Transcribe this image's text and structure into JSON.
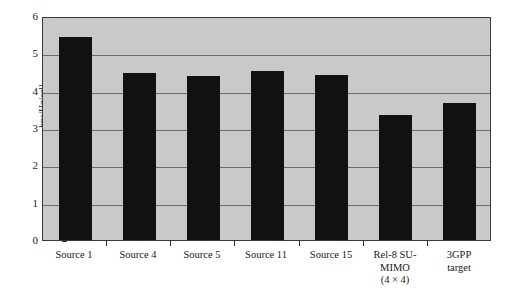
{
  "chart_data": {
    "type": "bar",
    "title": "",
    "subtitle": "",
    "xlabel": "",
    "ylabel": "bps/Hz/cell",
    "ylim": [
      0,
      6
    ],
    "yticks": [
      "0",
      "1",
      "2",
      "3",
      "4",
      "5",
      "6"
    ],
    "grid": "horizontal",
    "legend": "none",
    "categories": [
      "Source 1",
      "Source 4",
      "Source 5",
      "Source 11",
      "Source 15",
      "Rel-8 SU-MIMO (4 × 4)",
      "3GPP target"
    ],
    "category_label_lines": [
      [
        "Source 1"
      ],
      [
        "Source 4"
      ],
      [
        "Source 5"
      ],
      [
        "Source 11"
      ],
      [
        "Source 15"
      ],
      [
        "Rel-8 SU-",
        "MIMO",
        "(4 × 4)"
      ],
      [
        "3GPP",
        "target"
      ]
    ],
    "values": [
      5.44,
      4.48,
      4.4,
      4.53,
      4.42,
      3.35,
      3.67
    ],
    "bar_color": "#111111",
    "plot_background_color": "#c9c9c9",
    "gridline_color": "#6e6e6e",
    "axis_color": "#3a3a3a",
    "page_background_color": "#ffffff"
  }
}
